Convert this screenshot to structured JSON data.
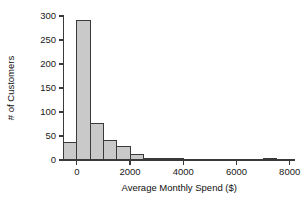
{
  "chart_data": {
    "type": "bar",
    "title": "",
    "subtitle": "",
    "xlabel": "Average Monthly Spend ($)",
    "ylabel": "# of Customers",
    "xlim": [
      -500,
      8200
    ],
    "ylim": [
      0,
      300
    ],
    "grid": false,
    "legend": null,
    "bin_width": 500,
    "xticks": [
      0,
      2000,
      4000,
      6000,
      8000
    ],
    "xtick_labels": [
      "0",
      "2000",
      "4000",
      "6000",
      "8000"
    ],
    "yticks": [
      0,
      50,
      100,
      150,
      200,
      250,
      300
    ],
    "ytick_labels": [
      "0",
      "50",
      "100",
      "150",
      "200",
      "250",
      "300"
    ],
    "bins": [
      {
        "x0": -500,
        "x1": 0,
        "value": 36
      },
      {
        "x0": 0,
        "x1": 500,
        "value": 290
      },
      {
        "x0": 500,
        "x1": 1000,
        "value": 77
      },
      {
        "x0": 1000,
        "x1": 1500,
        "value": 40
      },
      {
        "x0": 1500,
        "x1": 2000,
        "value": 28
      },
      {
        "x0": 2000,
        "x1": 2500,
        "value": 11
      },
      {
        "x0": 2500,
        "x1": 3000,
        "value": 3
      },
      {
        "x0": 3000,
        "x1": 3500,
        "value": 4
      },
      {
        "x0": 3500,
        "x1": 4000,
        "value": 2
      },
      {
        "x0": 7000,
        "x1": 7500,
        "value": 2
      }
    ],
    "bar_fill": "#c9c9c9",
    "bar_stroke": "#3a3a3a",
    "axis_color": "#3a3a3a",
    "background": "#ffffff"
  },
  "figure": {
    "alt": "Histogram of average monthly spend by number of customers"
  }
}
